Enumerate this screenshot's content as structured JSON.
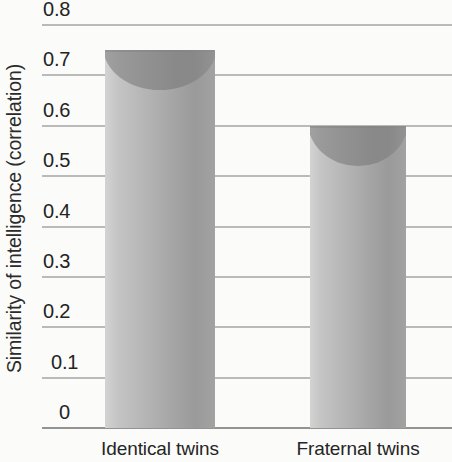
{
  "chart_data": {
    "type": "bar",
    "title": "",
    "xlabel": "",
    "ylabel": "Similarity of intelligence (correlation)",
    "categories": [
      "Identical twins",
      "Fraternal twins"
    ],
    "values": [
      0.75,
      0.6
    ],
    "ylim": [
      0,
      0.8
    ],
    "ytick_labels": [
      "0.8",
      "0.7",
      "0.6",
      "0.5",
      "0.4",
      "0.3",
      "0.2",
      "0.1",
      "0"
    ],
    "ytick_values": [
      0.8,
      0.7,
      0.6,
      0.5,
      0.4,
      0.3,
      0.2,
      0.1,
      0
    ],
    "grid": true,
    "legend": false,
    "bar_style": "3d-cylinder-gray",
    "colors": {
      "bar_light": "#d3d3d3",
      "bar_mid": "#b4b4b4",
      "bar_dark": "#9a9a9a",
      "gridline": "#a8a8a8",
      "baseline": "#8d8d8d",
      "background": "#fbfbfa",
      "text": "#232323"
    }
  },
  "axis": {
    "y_title": "Similarity of intelligence (correlation)",
    "ticks": [
      {
        "label": "0.8",
        "value": 0.8
      },
      {
        "label": "0.7",
        "value": 0.7
      },
      {
        "label": "0.6",
        "value": 0.6
      },
      {
        "label": "0.5",
        "value": 0.5
      },
      {
        "label": "0.4",
        "value": 0.4
      },
      {
        "label": "0.3",
        "value": 0.3
      },
      {
        "label": "0.2",
        "value": 0.2
      },
      {
        "label": "0.1",
        "value": 0.1
      },
      {
        "label": "0",
        "value": 0
      }
    ]
  },
  "bars": [
    {
      "label": "Identical twins",
      "value": 0.75
    },
    {
      "label": "Fraternal twins",
      "value": 0.6
    }
  ]
}
